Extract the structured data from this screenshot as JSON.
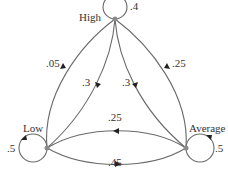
{
  "diagram": {
    "type": "markov-chain",
    "nodes": [
      {
        "id": "high",
        "label": "High",
        "self_loop": ".4"
      },
      {
        "id": "low",
        "label": "Low",
        "self_loop": ".5"
      },
      {
        "id": "average",
        "label": "Average",
        "self_loop": ".5"
      }
    ],
    "edges": {
      "low_to_high": ".05",
      "high_to_low": ".3",
      "high_to_average": ".3",
      "average_to_high": ".25",
      "average_to_low": ".25",
      "low_to_average": ".45"
    },
    "colors": {
      "edge": "#6a6a6a",
      "node": "#8a8a8a",
      "arrow": "#222222",
      "text": "#333333"
    }
  }
}
